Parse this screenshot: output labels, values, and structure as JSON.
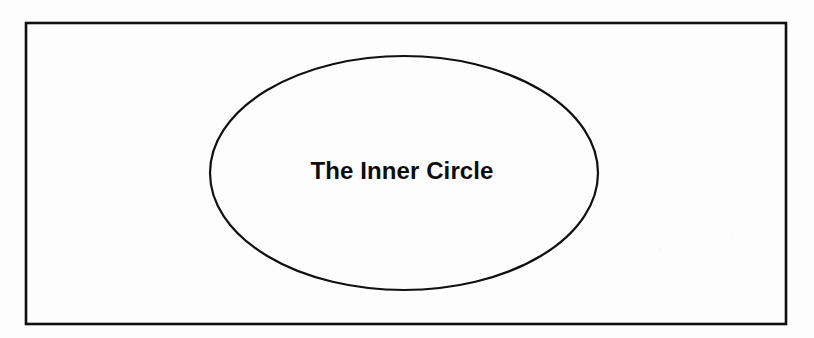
{
  "figure": {
    "name": "the-inner-circle-diagram",
    "type": "nested-shape-diagram",
    "width": 814,
    "height": 338,
    "background_color": "#fdfdfd",
    "stroke_color": "#101010",
    "medium": "scanned printed page"
  },
  "shapes": {
    "outer_rectangle": {
      "label": "",
      "shape": "rectangle",
      "x": 26,
      "y": 23,
      "width": 760,
      "height": 301,
      "stroke_width": 2.6,
      "fill": "none"
    },
    "inner_ellipse": {
      "label": "The Inner Circle",
      "shape": "ellipse",
      "center_x": 404,
      "center_y": 173,
      "radius_x": 194,
      "radius_y": 117,
      "stroke_width": 2.2,
      "fill": "none"
    }
  },
  "labels": {
    "inner_ellipse_text": "The Inner Circle",
    "inner_ellipse_text_x": 402,
    "inner_ellipse_text_y": 179,
    "inner_ellipse_font_size": "24px",
    "inner_ellipse_font_weight": "bold",
    "inner_ellipse_text_color": "#0d0d0d"
  }
}
